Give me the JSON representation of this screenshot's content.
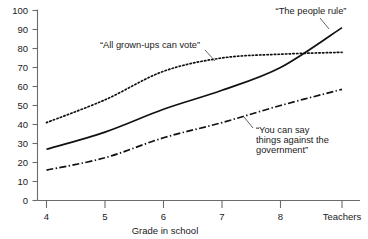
{
  "chart_data": {
    "type": "line",
    "title": "",
    "xlabel": "Grade in school",
    "ylabel": "",
    "categories": [
      "4",
      "5",
      "6",
      "7",
      "8",
      "Teachers"
    ],
    "ylim": [
      0,
      100
    ],
    "yticks": [
      0,
      10,
      20,
      30,
      40,
      50,
      60,
      70,
      80,
      90,
      100
    ],
    "grid": false,
    "legend_position": "inline-annotations",
    "series": [
      {
        "name": "“All grown-ups can vote”",
        "style": "dotted",
        "values": [
          41,
          53,
          68,
          75,
          77,
          78
        ]
      },
      {
        "name": "“The people rule”",
        "style": "solid",
        "values": [
          27,
          36,
          48,
          58,
          70,
          91
        ]
      },
      {
        "name": "“You can say things against the government”",
        "style": "dash-dot",
        "values": [
          16,
          22.5,
          33,
          41,
          50,
          58.5
        ]
      }
    ],
    "annotations": [
      {
        "text": "“All grown-ups can vote”",
        "lines": [
          "“All grown-ups can vote”"
        ]
      },
      {
        "text": "“The people rule”",
        "lines": [
          "“The people rule”"
        ]
      },
      {
        "text": "“You can say things against the government”",
        "lines": [
          "“You can say",
          "things against the",
          "government”"
        ]
      }
    ]
  },
  "axis": {
    "x_title": "Grade in school",
    "x_ticks": [
      "4",
      "5",
      "6",
      "7",
      "8",
      "Teachers"
    ],
    "y_ticks": [
      "0",
      "10",
      "20",
      "30",
      "40",
      "50",
      "60",
      "70",
      "80",
      "90",
      "100"
    ]
  },
  "labels": {
    "vote": "“All grown-ups can vote”",
    "people_rule": "“The people rule”",
    "say_line1": "“You can say",
    "say_line2": "things against the",
    "say_line3": "government”"
  },
  "colors": {
    "line": "#111111",
    "axis": "#6b6b6b",
    "text": "#1a1a1a",
    "background": "#ffffff"
  }
}
